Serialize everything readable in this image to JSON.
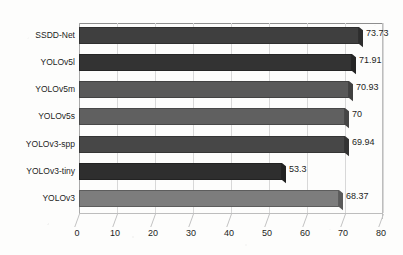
{
  "chart_data": {
    "type": "bar",
    "orientation": "horizontal",
    "title": "",
    "subtitle": "",
    "xlabel": "",
    "ylabel": "",
    "xlim": [
      0,
      80
    ],
    "xticks": [
      "0",
      "10",
      "20",
      "30",
      "40",
      "50",
      "60",
      "70",
      "80"
    ],
    "grid": true,
    "legend": false,
    "legend_position": "none",
    "categories": [
      "SSDD-Net",
      "YOLOv5l",
      "YOLOv5m",
      "YOLOv5s",
      "YOLOv3-spp",
      "YOLOv3-tiny",
      "YOLOv3"
    ],
    "values": [
      73.73,
      71.91,
      70.93,
      70,
      69.94,
      53.3,
      68.37
    ],
    "data_labels": [
      "73.73",
      "71.91",
      "70.93",
      "70",
      "69.94",
      "53.3",
      "68.37"
    ],
    "bar_colors": [
      "#3f3f3f",
      "#333333",
      "#595959",
      "#606060",
      "#474747",
      "#2e2e2e",
      "#7d7d7d"
    ]
  },
  "style": {
    "background": "#fdfdfc",
    "gridline_color": "#d8d8d8",
    "axis_color": "#8e8e8e",
    "text_color": "#1d1d1d"
  }
}
